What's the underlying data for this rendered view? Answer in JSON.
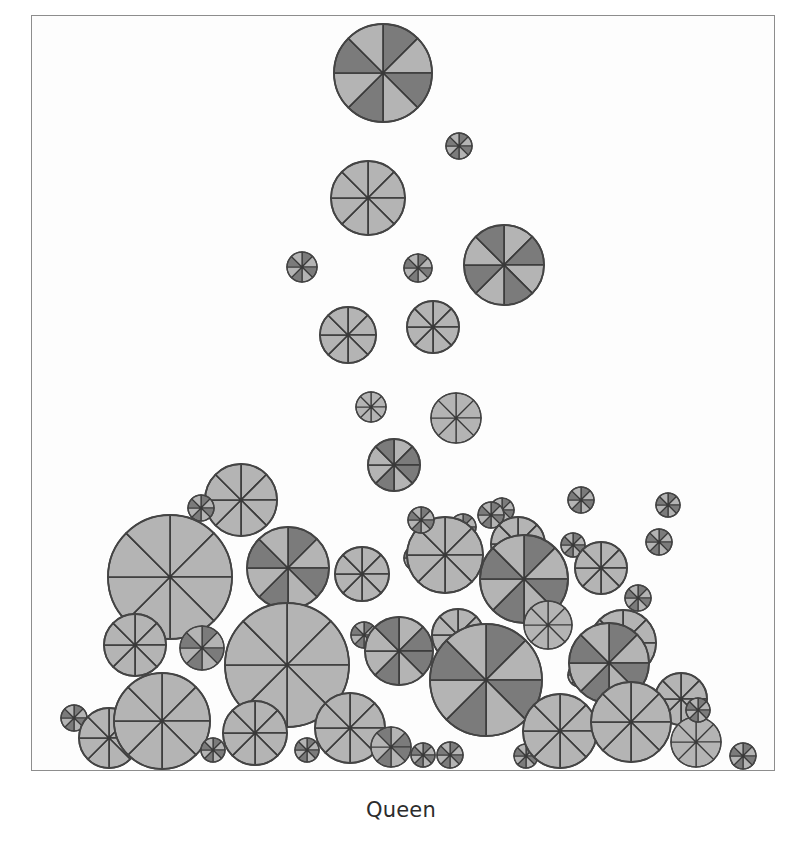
{
  "figure": {
    "caption": "Queen",
    "background_color": "#ffffff",
    "plot_background_color": "#fdfdfd",
    "frame_color": "#8d8d8d",
    "glyph_outline_color": "#444444",
    "sector_divider_color": "#3a3a3a"
  },
  "palette": {
    "light": "#b4b4b4",
    "mid": "#a0a0a0",
    "dark": "#7b7b7b",
    "darker": "#6e6e6e"
  },
  "chart_data": {
    "type": "scatter",
    "title": "Queen",
    "subtitle": "",
    "xlabel": "",
    "ylabel": "",
    "xlim": [
      0,
      744
    ],
    "ylim": [
      0,
      756
    ],
    "grid": false,
    "legend": null,
    "glyph": {
      "shape": "pie-circle",
      "sectors": 8,
      "sector_start_angle_deg": -90,
      "shade_levels": [
        "#b4b4b4",
        "#a0a0a0",
        "#7b7b7b",
        "#6e6e6e"
      ]
    },
    "points": [
      {
        "id": 1,
        "x": 352,
        "y": 58,
        "r": 49,
        "shades": [
          "#7b7b7b",
          "#b4b4b4",
          "#7b7b7b",
          "#b4b4b4",
          "#7b7b7b",
          "#b4b4b4",
          "#7b7b7b",
          "#b4b4b4"
        ]
      },
      {
        "id": 2,
        "x": 428,
        "y": 131,
        "r": 13,
        "shades": [
          "#7b7b7b",
          "#b4b4b4",
          "#7b7b7b",
          "#b4b4b4",
          "#7b7b7b",
          "#b4b4b4",
          "#7b7b7b",
          "#b4b4b4"
        ]
      },
      {
        "id": 3,
        "x": 337,
        "y": 183,
        "r": 37,
        "shades": [
          "#b4b4b4",
          "#b4b4b4",
          "#b4b4b4",
          "#b4b4b4",
          "#b4b4b4",
          "#b4b4b4",
          "#b4b4b4",
          "#b4b4b4"
        ]
      },
      {
        "id": 4,
        "x": 271,
        "y": 252,
        "r": 15,
        "shades": [
          "#7b7b7b",
          "#b4b4b4",
          "#7b7b7b",
          "#b4b4b4",
          "#7b7b7b",
          "#b4b4b4",
          "#7b7b7b",
          "#b4b4b4"
        ]
      },
      {
        "id": 5,
        "x": 387,
        "y": 253,
        "r": 14,
        "shades": [
          "#7b7b7b",
          "#b4b4b4",
          "#7b7b7b",
          "#b4b4b4",
          "#7b7b7b",
          "#b4b4b4",
          "#7b7b7b",
          "#b4b4b4"
        ]
      },
      {
        "id": 6,
        "x": 473,
        "y": 250,
        "r": 40,
        "shades": [
          "#b4b4b4",
          "#7b7b7b",
          "#b4b4b4",
          "#7b7b7b",
          "#b4b4b4",
          "#7b7b7b",
          "#b4b4b4",
          "#7b7b7b"
        ]
      },
      {
        "id": 7,
        "x": 317,
        "y": 320,
        "r": 28,
        "shades": [
          "#b4b4b4",
          "#b4b4b4",
          "#b4b4b4",
          "#b4b4b4",
          "#b4b4b4",
          "#b4b4b4",
          "#b4b4b4",
          "#b4b4b4"
        ]
      },
      {
        "id": 8,
        "x": 402,
        "y": 312,
        "r": 26,
        "shades": [
          "#b4b4b4",
          "#b4b4b4",
          "#b4b4b4",
          "#b4b4b4",
          "#b4b4b4",
          "#b4b4b4",
          "#b4b4b4",
          "#b4b4b4"
        ]
      },
      {
        "id": 9,
        "x": 340,
        "y": 392,
        "r": 15,
        "shades": [
          "#b4b4b4",
          "#b4b4b4",
          "#b4b4b4",
          "#b4b4b4",
          "#b4b4b4",
          "#b4b4b4",
          "#b4b4b4",
          "#b4b4b4"
        ]
      },
      {
        "id": 10,
        "x": 425,
        "y": 403,
        "r": 25,
        "shades": [
          "#b4b4b4",
          "#b4b4b4",
          "#b4b4b4",
          "#b4b4b4",
          "#b4b4b4",
          "#b4b4b4",
          "#b4b4b4",
          "#b4b4b4"
        ]
      },
      {
        "id": 11,
        "x": 363,
        "y": 450,
        "r": 26,
        "shades": [
          "#b4b4b4",
          "#7b7b7b",
          "#7b7b7b",
          "#b4b4b4",
          "#7b7b7b",
          "#b4b4b4",
          "#b4b4b4",
          "#7b7b7b"
        ]
      },
      {
        "id": 12,
        "x": 210,
        "y": 485,
        "r": 36,
        "shades": [
          "#b4b4b4",
          "#b4b4b4",
          "#b4b4b4",
          "#b4b4b4",
          "#b4b4b4",
          "#b4b4b4",
          "#b4b4b4",
          "#b4b4b4"
        ]
      },
      {
        "id": 13,
        "x": 170,
        "y": 493,
        "r": 13,
        "shades": [
          "#7b7b7b",
          "#b4b4b4",
          "#7b7b7b",
          "#b4b4b4",
          "#7b7b7b",
          "#b4b4b4",
          "#7b7b7b",
          "#b4b4b4"
        ]
      },
      {
        "id": 14,
        "x": 432,
        "y": 512,
        "r": 13,
        "shades": [
          "#7b7b7b",
          "#b4b4b4",
          "#7b7b7b",
          "#b4b4b4",
          "#7b7b7b",
          "#b4b4b4",
          "#7b7b7b",
          "#b4b4b4"
        ]
      },
      {
        "id": 15,
        "x": 471,
        "y": 495,
        "r": 12,
        "shades": [
          "#7b7b7b",
          "#b4b4b4",
          "#7b7b7b",
          "#b4b4b4",
          "#7b7b7b",
          "#b4b4b4",
          "#7b7b7b",
          "#b4b4b4"
        ]
      },
      {
        "id": 16,
        "x": 139,
        "y": 562,
        "r": 62,
        "shades": [
          "#b4b4b4",
          "#b4b4b4",
          "#b4b4b4",
          "#b4b4b4",
          "#b4b4b4",
          "#b4b4b4",
          "#b4b4b4",
          "#b4b4b4"
        ]
      },
      {
        "id": 17,
        "x": 257,
        "y": 553,
        "r": 41,
        "shades": [
          "#7b7b7b",
          "#b4b4b4",
          "#7b7b7b",
          "#b4b4b4",
          "#7b7b7b",
          "#b4b4b4",
          "#7b7b7b",
          "#b4b4b4"
        ]
      },
      {
        "id": 18,
        "x": 331,
        "y": 559,
        "r": 27,
        "shades": [
          "#b4b4b4",
          "#b4b4b4",
          "#b4b4b4",
          "#b4b4b4",
          "#b4b4b4",
          "#b4b4b4",
          "#b4b4b4",
          "#b4b4b4"
        ]
      },
      {
        "id": 19,
        "x": 386,
        "y": 543,
        "r": 13,
        "shades": [
          "#7b7b7b",
          "#b4b4b4",
          "#7b7b7b",
          "#b4b4b4",
          "#7b7b7b",
          "#b4b4b4",
          "#7b7b7b",
          "#b4b4b4"
        ]
      },
      {
        "id": 20,
        "x": 414,
        "y": 540,
        "r": 38,
        "shades": [
          "#b4b4b4",
          "#b4b4b4",
          "#b4b4b4",
          "#b4b4b4",
          "#b4b4b4",
          "#b4b4b4",
          "#b4b4b4",
          "#b4b4b4"
        ]
      },
      {
        "id": 21,
        "x": 460,
        "y": 500,
        "r": 13,
        "shades": [
          "#7b7b7b",
          "#b4b4b4",
          "#7b7b7b",
          "#b4b4b4",
          "#7b7b7b",
          "#b4b4b4",
          "#7b7b7b",
          "#b4b4b4"
        ]
      },
      {
        "id": 22,
        "x": 487,
        "y": 529,
        "r": 27,
        "shades": [
          "#b4b4b4",
          "#b4b4b4",
          "#b4b4b4",
          "#b4b4b4",
          "#b4b4b4",
          "#b4b4b4",
          "#b4b4b4",
          "#b4b4b4"
        ]
      },
      {
        "id": 23,
        "x": 493,
        "y": 564,
        "r": 44,
        "shades": [
          "#7b7b7b",
          "#b4b4b4",
          "#7b7b7b",
          "#b4b4b4",
          "#7b7b7b",
          "#b4b4b4",
          "#7b7b7b",
          "#b4b4b4"
        ]
      },
      {
        "id": 24,
        "x": 542,
        "y": 530,
        "r": 12,
        "shades": [
          "#7b7b7b",
          "#b4b4b4",
          "#7b7b7b",
          "#b4b4b4",
          "#7b7b7b",
          "#b4b4b4",
          "#7b7b7b",
          "#b4b4b4"
        ]
      },
      {
        "id": 25,
        "x": 570,
        "y": 553,
        "r": 26,
        "shades": [
          "#b4b4b4",
          "#b4b4b4",
          "#b4b4b4",
          "#b4b4b4",
          "#b4b4b4",
          "#b4b4b4",
          "#b4b4b4",
          "#b4b4b4"
        ]
      },
      {
        "id": 26,
        "x": 607,
        "y": 583,
        "r": 13,
        "shades": [
          "#7b7b7b",
          "#b4b4b4",
          "#7b7b7b",
          "#b4b4b4",
          "#7b7b7b",
          "#b4b4b4",
          "#7b7b7b",
          "#b4b4b4"
        ]
      },
      {
        "id": 27,
        "x": 592,
        "y": 628,
        "r": 33,
        "shades": [
          "#b4b4b4",
          "#b4b4b4",
          "#b4b4b4",
          "#b4b4b4",
          "#b4b4b4",
          "#b4b4b4",
          "#b4b4b4",
          "#b4b4b4"
        ]
      },
      {
        "id": 28,
        "x": 104,
        "y": 630,
        "r": 31,
        "shades": [
          "#b4b4b4",
          "#b4b4b4",
          "#b4b4b4",
          "#b4b4b4",
          "#b4b4b4",
          "#b4b4b4",
          "#b4b4b4",
          "#b4b4b4"
        ]
      },
      {
        "id": 29,
        "x": 171,
        "y": 633,
        "r": 22,
        "shades": [
          "#7b7b7b",
          "#b4b4b4",
          "#7b7b7b",
          "#b4b4b4",
          "#7b7b7b",
          "#b4b4b4",
          "#7b7b7b",
          "#b4b4b4"
        ]
      },
      {
        "id": 30,
        "x": 256,
        "y": 650,
        "r": 62,
        "shades": [
          "#b4b4b4",
          "#b4b4b4",
          "#b4b4b4",
          "#b4b4b4",
          "#b4b4b4",
          "#b4b4b4",
          "#b4b4b4",
          "#b4b4b4"
        ]
      },
      {
        "id": 31,
        "x": 333,
        "y": 620,
        "r": 13,
        "shades": [
          "#7b7b7b",
          "#b4b4b4",
          "#7b7b7b",
          "#b4b4b4",
          "#7b7b7b",
          "#b4b4b4",
          "#7b7b7b",
          "#b4b4b4"
        ]
      },
      {
        "id": 32,
        "x": 368,
        "y": 636,
        "r": 34,
        "shades": [
          "#b4b4b4",
          "#7b7b7b",
          "#7b7b7b",
          "#b4b4b4",
          "#7b7b7b",
          "#b4b4b4",
          "#b4b4b4",
          "#7b7b7b"
        ]
      },
      {
        "id": 33,
        "x": 427,
        "y": 620,
        "r": 26,
        "shades": [
          "#b4b4b4",
          "#b4b4b4",
          "#b4b4b4",
          "#b4b4b4",
          "#b4b4b4",
          "#b4b4b4",
          "#b4b4b4",
          "#b4b4b4"
        ]
      },
      {
        "id": 34,
        "x": 455,
        "y": 665,
        "r": 56,
        "shades": [
          "#7b7b7b",
          "#b4b4b4",
          "#7b7b7b",
          "#b4b4b4",
          "#7b7b7b",
          "#b4b4b4",
          "#7b7b7b",
          "#b4b4b4"
        ]
      },
      {
        "id": 35,
        "x": 517,
        "y": 610,
        "r": 24,
        "shades": [
          "#b4b4b4",
          "#b4b4b4",
          "#b4b4b4",
          "#b4b4b4",
          "#b4b4b4",
          "#b4b4b4",
          "#b4b4b4",
          "#b4b4b4"
        ]
      },
      {
        "id": 36,
        "x": 549,
        "y": 660,
        "r": 12,
        "shades": [
          "#7b7b7b",
          "#b4b4b4",
          "#7b7b7b",
          "#b4b4b4",
          "#7b7b7b",
          "#b4b4b4",
          "#7b7b7b",
          "#b4b4b4"
        ]
      },
      {
        "id": 37,
        "x": 578,
        "y": 648,
        "r": 40,
        "shades": [
          "#7b7b7b",
          "#b4b4b4",
          "#7b7b7b",
          "#b4b4b4",
          "#7b7b7b",
          "#b4b4b4",
          "#7b7b7b",
          "#b4b4b4"
        ]
      },
      {
        "id": 38,
        "x": 650,
        "y": 684,
        "r": 26,
        "shades": [
          "#b4b4b4",
          "#b4b4b4",
          "#b4b4b4",
          "#b4b4b4",
          "#b4b4b4",
          "#b4b4b4",
          "#b4b4b4",
          "#b4b4b4"
        ]
      },
      {
        "id": 39,
        "x": 43,
        "y": 703,
        "r": 13,
        "shades": [
          "#7b7b7b",
          "#b4b4b4",
          "#7b7b7b",
          "#b4b4b4",
          "#7b7b7b",
          "#b4b4b4",
          "#7b7b7b",
          "#b4b4b4"
        ]
      },
      {
        "id": 40,
        "x": 78,
        "y": 723,
        "r": 30,
        "shades": [
          "#b4b4b4",
          "#b4b4b4",
          "#b4b4b4",
          "#b4b4b4",
          "#b4b4b4",
          "#b4b4b4",
          "#b4b4b4",
          "#b4b4b4"
        ]
      },
      {
        "id": 41,
        "x": 131,
        "y": 706,
        "r": 48,
        "shades": [
          "#b4b4b4",
          "#b4b4b4",
          "#b4b4b4",
          "#b4b4b4",
          "#b4b4b4",
          "#b4b4b4",
          "#b4b4b4",
          "#b4b4b4"
        ]
      },
      {
        "id": 42,
        "x": 182,
        "y": 735,
        "r": 12,
        "shades": [
          "#7b7b7b",
          "#b4b4b4",
          "#7b7b7b",
          "#b4b4b4",
          "#7b7b7b",
          "#b4b4b4",
          "#7b7b7b",
          "#b4b4b4"
        ]
      },
      {
        "id": 43,
        "x": 224,
        "y": 718,
        "r": 32,
        "shades": [
          "#b4b4b4",
          "#b4b4b4",
          "#b4b4b4",
          "#b4b4b4",
          "#b4b4b4",
          "#b4b4b4",
          "#b4b4b4",
          "#b4b4b4"
        ]
      },
      {
        "id": 44,
        "x": 276,
        "y": 735,
        "r": 12,
        "shades": [
          "#7b7b7b",
          "#b4b4b4",
          "#7b7b7b",
          "#b4b4b4",
          "#7b7b7b",
          "#b4b4b4",
          "#7b7b7b",
          "#b4b4b4"
        ]
      },
      {
        "id": 45,
        "x": 319,
        "y": 713,
        "r": 35,
        "shades": [
          "#b4b4b4",
          "#b4b4b4",
          "#b4b4b4",
          "#b4b4b4",
          "#b4b4b4",
          "#b4b4b4",
          "#b4b4b4",
          "#b4b4b4"
        ]
      },
      {
        "id": 46,
        "x": 360,
        "y": 732,
        "r": 20,
        "shades": [
          "#b4b4b4",
          "#7b7b7b",
          "#7b7b7b",
          "#b4b4b4",
          "#7b7b7b",
          "#b4b4b4",
          "#b4b4b4",
          "#7b7b7b"
        ]
      },
      {
        "id": 47,
        "x": 392,
        "y": 740,
        "r": 12,
        "shades": [
          "#7b7b7b",
          "#b4b4b4",
          "#7b7b7b",
          "#b4b4b4",
          "#7b7b7b",
          "#b4b4b4",
          "#7b7b7b",
          "#b4b4b4"
        ]
      },
      {
        "id": 48,
        "x": 419,
        "y": 740,
        "r": 13,
        "shades": [
          "#7b7b7b",
          "#b4b4b4",
          "#7b7b7b",
          "#b4b4b4",
          "#7b7b7b",
          "#b4b4b4",
          "#7b7b7b",
          "#b4b4b4"
        ]
      },
      {
        "id": 49,
        "x": 495,
        "y": 741,
        "r": 12,
        "shades": [
          "#7b7b7b",
          "#b4b4b4",
          "#7b7b7b",
          "#b4b4b4",
          "#7b7b7b",
          "#b4b4b4",
          "#7b7b7b",
          "#b4b4b4"
        ]
      },
      {
        "id": 50,
        "x": 529,
        "y": 716,
        "r": 37,
        "shades": [
          "#b4b4b4",
          "#b4b4b4",
          "#b4b4b4",
          "#b4b4b4",
          "#b4b4b4",
          "#b4b4b4",
          "#b4b4b4",
          "#b4b4b4"
        ]
      },
      {
        "id": 51,
        "x": 600,
        "y": 707,
        "r": 40,
        "shades": [
          "#b4b4b4",
          "#b4b4b4",
          "#b4b4b4",
          "#b4b4b4",
          "#b4b4b4",
          "#b4b4b4",
          "#b4b4b4",
          "#b4b4b4"
        ]
      },
      {
        "id": 52,
        "x": 665,
        "y": 727,
        "r": 25,
        "shades": [
          "#b4b4b4",
          "#b4b4b4",
          "#b4b4b4",
          "#b4b4b4",
          "#b4b4b4",
          "#b4b4b4",
          "#b4b4b4",
          "#b4b4b4"
        ]
      },
      {
        "id": 53,
        "x": 667,
        "y": 695,
        "r": 12,
        "shades": [
          "#7b7b7b",
          "#b4b4b4",
          "#7b7b7b",
          "#b4b4b4",
          "#7b7b7b",
          "#b4b4b4",
          "#7b7b7b",
          "#b4b4b4"
        ]
      },
      {
        "id": 54,
        "x": 712,
        "y": 741,
        "r": 13,
        "shades": [
          "#7b7b7b",
          "#b4b4b4",
          "#7b7b7b",
          "#b4b4b4",
          "#7b7b7b",
          "#b4b4b4",
          "#7b7b7b",
          "#b4b4b4"
        ]
      },
      {
        "id": 55,
        "x": 628,
        "y": 527,
        "r": 13,
        "shades": [
          "#7b7b7b",
          "#b4b4b4",
          "#7b7b7b",
          "#b4b4b4",
          "#7b7b7b",
          "#b4b4b4",
          "#7b7b7b",
          "#b4b4b4"
        ]
      },
      {
        "id": 56,
        "x": 637,
        "y": 490,
        "r": 12,
        "shades": [
          "#7b7b7b",
          "#b4b4b4",
          "#7b7b7b",
          "#b4b4b4",
          "#7b7b7b",
          "#b4b4b4",
          "#7b7b7b",
          "#b4b4b4"
        ]
      },
      {
        "id": 57,
        "x": 550,
        "y": 485,
        "r": 13,
        "shades": [
          "#7b7b7b",
          "#b4b4b4",
          "#7b7b7b",
          "#b4b4b4",
          "#7b7b7b",
          "#b4b4b4",
          "#7b7b7b",
          "#b4b4b4"
        ]
      },
      {
        "id": 58,
        "x": 390,
        "y": 505,
        "r": 13,
        "shades": [
          "#7b7b7b",
          "#b4b4b4",
          "#7b7b7b",
          "#b4b4b4",
          "#7b7b7b",
          "#b4b4b4",
          "#7b7b7b",
          "#b4b4b4"
        ]
      }
    ]
  }
}
